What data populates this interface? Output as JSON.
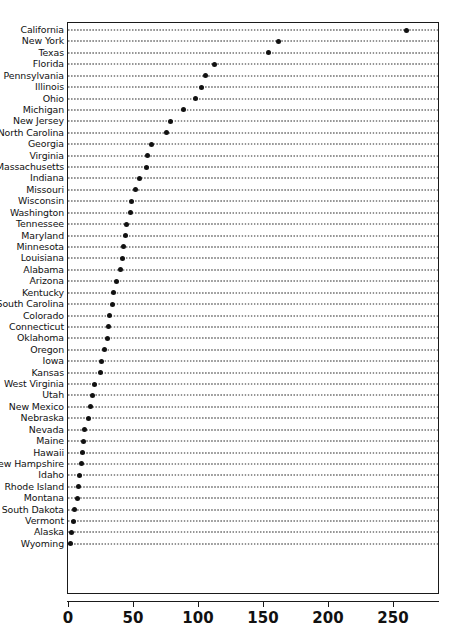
{
  "chart_data": {
    "type": "scatter",
    "subtype": "cleveland-dot-plot",
    "title": "",
    "subtitle": "",
    "xlabel": "",
    "ylabel": "",
    "xlim": [
      0,
      276
    ],
    "xticks": [
      0,
      50,
      100,
      150,
      200,
      250
    ],
    "xticklabels": [
      "0",
      "50",
      "100",
      "150",
      "200",
      "250"
    ],
    "grid": "dotted-horizontal-leader-lines",
    "legend": "none",
    "sorted": "descending",
    "categories": [
      "California",
      "New York",
      "Texas",
      "Florida",
      "Pennsylvania",
      "Illinois",
      "Ohio",
      "Michigan",
      "New Jersey",
      "North Carolina",
      "Georgia",
      "Virginia",
      "Massachusetts",
      "Indiana",
      "Missouri",
      "Wisconsin",
      "Washington",
      "Tennessee",
      "Maryland",
      "Minnesota",
      "Louisiana",
      "Alabama",
      "Arizona",
      "Kentucky",
      "South Carolina",
      "Colorado",
      "Connecticut",
      "Oklahoma",
      "Oregon",
      "Iowa",
      "Kansas",
      "West Virginia",
      "Utah",
      "New Mexico",
      "Nebraska",
      "Nevada",
      "Maine",
      "Hawaii",
      "New Hampshire",
      "Idaho",
      "Rhode Island",
      "Montana",
      "South Dakota",
      "Vermont",
      "Alaska",
      "Wyoming"
    ],
    "values": [
      260,
      162,
      154,
      113,
      106,
      103,
      98,
      89,
      79,
      76,
      64,
      61,
      60,
      55,
      52,
      49,
      48,
      45,
      44,
      43,
      42,
      40,
      37,
      35,
      34,
      32,
      31,
      30,
      28,
      26,
      25,
      20,
      19,
      17,
      16,
      13,
      12,
      11,
      10,
      9,
      8,
      7,
      5,
      4,
      3,
      2
    ],
    "n_points": 46,
    "marker": "filled-circle",
    "marker_color": "#111111"
  },
  "axis": {
    "tick_font_weight": "bold",
    "frame_color": "#1a1a1a"
  }
}
